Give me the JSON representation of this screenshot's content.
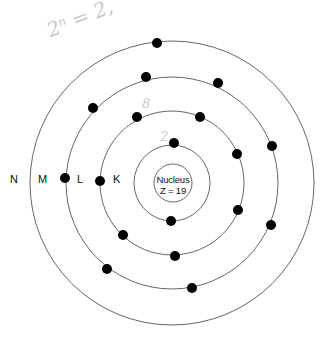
{
  "diagram": {
    "nucleus": {
      "label": "Nucleus",
      "charge": "Z = 19"
    },
    "shells": [
      {
        "name": "K",
        "electrons": 2
      },
      {
        "name": "L",
        "electrons": 8
      },
      {
        "name": "M",
        "electrons": 8
      },
      {
        "name": "N",
        "electrons": 1
      }
    ],
    "labels": {
      "N": "N",
      "M": "M",
      "L": "L",
      "K": "K"
    },
    "handwriting": {
      "formula": "2ⁿ = 2,",
      "l_count": "8",
      "k_count": "2"
    }
  }
}
